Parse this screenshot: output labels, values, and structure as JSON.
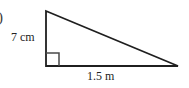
{
  "figure": {
    "item_marker": ")",
    "shape": "right-triangle",
    "background_color": "#ffffff",
    "stroke_color": "#1f1f1f",
    "stroke_width": 1.8,
    "vertices": {
      "top": {
        "x": 46,
        "y": 11
      },
      "bottom_left": {
        "x": 46,
        "y": 66
      },
      "bottom_right": {
        "x": 178,
        "y": 66
      }
    },
    "right_angle": {
      "at_vertex": "bottom_left",
      "marker_size": 13
    },
    "labels": {
      "vertical_leg": "7 cm",
      "horizontal_leg": "1.5 m"
    },
    "measurements": [
      {
        "side": "vertical_leg",
        "value": 7,
        "unit": "cm",
        "text": "7 cm"
      },
      {
        "side": "horizontal_leg",
        "value": 1.5,
        "unit": "m",
        "text": "1.5 m"
      }
    ]
  }
}
